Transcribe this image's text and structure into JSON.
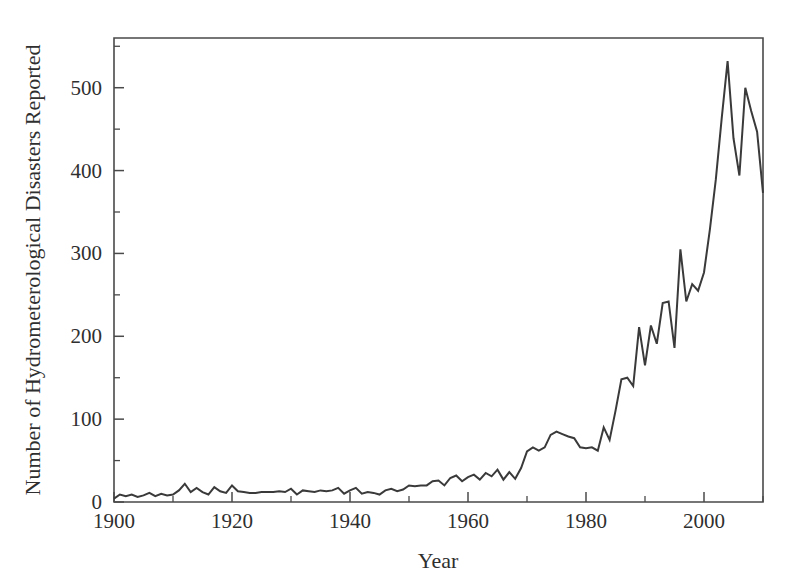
{
  "chart_data": {
    "type": "line",
    "title": "",
    "subtitle": "",
    "xlabel": "Year",
    "ylabel": "Number of Hydrometerological Disasters Reported",
    "xlim": [
      1900,
      2010
    ],
    "ylim": [
      0,
      560
    ],
    "grid": false,
    "legend": false,
    "legend_position": "none",
    "line_color": "#3a3a3a",
    "background_color": "#ffffff",
    "axis_color": "#4a4a4a",
    "xticks": [
      1900,
      1920,
      1940,
      1960,
      1980,
      2000
    ],
    "xtick_labels": [
      "1900",
      "1920",
      "1940",
      "1960",
      "1980",
      "2000"
    ],
    "xticks_minor": [
      1910,
      1930,
      1950,
      1970,
      1990,
      2010
    ],
    "yticks": [
      0,
      100,
      200,
      300,
      400,
      500
    ],
    "ytick_labels": [
      "0",
      "100",
      "200",
      "300",
      "400",
      "500"
    ],
    "yticks_minor": [
      50,
      150,
      250,
      350,
      450,
      550
    ],
    "series": [
      {
        "name": "Hydrometerological disasters reported",
        "x": [
          1900,
          1901,
          1902,
          1903,
          1904,
          1905,
          1906,
          1907,
          1908,
          1909,
          1910,
          1911,
          1912,
          1913,
          1914,
          1915,
          1916,
          1917,
          1918,
          1919,
          1920,
          1921,
          1922,
          1923,
          1924,
          1925,
          1926,
          1927,
          1928,
          1929,
          1930,
          1931,
          1932,
          1933,
          1934,
          1935,
          1936,
          1937,
          1938,
          1939,
          1940,
          1941,
          1942,
          1943,
          1944,
          1945,
          1946,
          1947,
          1948,
          1949,
          1950,
          1951,
          1952,
          1953,
          1954,
          1955,
          1956,
          1957,
          1958,
          1959,
          1960,
          1961,
          1962,
          1963,
          1964,
          1965,
          1966,
          1967,
          1968,
          1969,
          1970,
          1971,
          1972,
          1973,
          1974,
          1975,
          1976,
          1977,
          1978,
          1979,
          1980,
          1981,
          1982,
          1983,
          1984,
          1985,
          1986,
          1987,
          1988,
          1989,
          1990,
          1991,
          1992,
          1993,
          1994,
          1995,
          1996,
          1997,
          1998,
          1999,
          2000,
          2001,
          2002,
          2003,
          2004,
          2005,
          2006,
          2007,
          2008,
          2009,
          2010
        ],
        "values": [
          4,
          9,
          7,
          9,
          6,
          8,
          11,
          7,
          10,
          8,
          9,
          14,
          22,
          12,
          17,
          12,
          9,
          18,
          13,
          11,
          20,
          13,
          12,
          11,
          11,
          12,
          12,
          12,
          13,
          12,
          16,
          9,
          14,
          13,
          12,
          14,
          13,
          14,
          17,
          10,
          14,
          17,
          10,
          12,
          11,
          9,
          14,
          16,
          13,
          15,
          20,
          19,
          20,
          20,
          25,
          26,
          20,
          29,
          32,
          25,
          30,
          33,
          27,
          35,
          31,
          39,
          27,
          36,
          28,
          41,
          61,
          66,
          62,
          66,
          81,
          85,
          82,
          79,
          77,
          66,
          65,
          66,
          62,
          90,
          75,
          110,
          148,
          150,
          140,
          211,
          165,
          213,
          191,
          240,
          242,
          186,
          305,
          242,
          263,
          255,
          277,
          329,
          389,
          463,
          532,
          439,
          394,
          500,
          472,
          447,
          373
        ]
      }
    ],
    "annotations": []
  },
  "figure": {
    "plot_area": {
      "left_px": 114,
      "right_px": 763,
      "top_px": 38,
      "bottom_px": 502
    }
  }
}
